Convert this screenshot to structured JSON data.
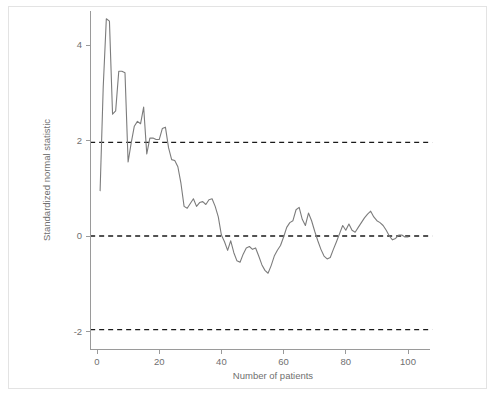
{
  "figure": {
    "background_color": "#ffffff",
    "border_color": "#e3e3e3",
    "line_color": "#7c7c7c",
    "reference_line_color": "#1a1a1a",
    "axis_color": "#9a9a9a",
    "text_color": "#6f6f6f"
  },
  "chart_data": {
    "type": "line",
    "title": "",
    "subtitle": "",
    "xlabel": "Number of patients",
    "ylabel": "Standardized normal statistic",
    "xlim": [
      -2,
      107
    ],
    "ylim": [
      -2.45,
      4.75
    ],
    "xticks": [
      0,
      20,
      40,
      60,
      80,
      100
    ],
    "xtick_labels": [
      "0",
      "20",
      "40",
      "60",
      "80",
      "100"
    ],
    "yticks": [
      -2,
      0,
      2,
      4
    ],
    "ytick_labels": [
      "-2",
      "0",
      "2",
      "4"
    ],
    "grid": false,
    "legend": null,
    "legend_position": "none",
    "annotations": [],
    "reference_lines": [
      {
        "name": "upper-boundary",
        "y": 1.96,
        "style": "dashed",
        "label": ""
      },
      {
        "name": "zero-line",
        "y": 0.0,
        "style": "dashed",
        "label": ""
      },
      {
        "name": "lower-boundary",
        "y": -1.96,
        "style": "dashed",
        "label": ""
      }
    ],
    "series": [
      {
        "name": "Standardized normal statistic",
        "x": [
          1,
          2,
          3,
          4,
          5,
          6,
          7,
          8,
          9,
          10,
          11,
          12,
          13,
          14,
          15,
          16,
          17,
          18,
          19,
          20,
          21,
          22,
          23,
          24,
          25,
          26,
          27,
          28,
          29,
          30,
          31,
          32,
          33,
          34,
          35,
          36,
          37,
          38,
          39,
          40,
          41,
          42,
          43,
          44,
          45,
          46,
          47,
          48,
          49,
          50,
          51,
          52,
          53,
          54,
          55,
          56,
          57,
          58,
          59,
          60,
          61,
          62,
          63,
          64,
          65,
          66,
          67,
          68,
          69,
          70,
          71,
          72,
          73,
          74,
          75,
          76,
          77,
          78,
          79,
          80,
          81,
          82,
          83,
          84,
          85,
          86,
          87,
          88,
          89,
          90,
          91,
          92,
          93,
          94,
          95,
          96,
          97,
          98,
          99,
          100
        ],
        "values": [
          0.95,
          3.12,
          4.55,
          4.5,
          2.55,
          2.62,
          3.45,
          3.45,
          3.42,
          1.55,
          1.95,
          2.3,
          2.4,
          2.35,
          2.7,
          1.72,
          2.05,
          2.05,
          2.02,
          2.02,
          2.25,
          2.28,
          1.85,
          1.6,
          1.58,
          1.45,
          1.1,
          0.62,
          0.58,
          0.68,
          0.78,
          0.62,
          0.7,
          0.72,
          0.66,
          0.76,
          0.78,
          0.62,
          0.4,
          0.02,
          -0.12,
          -0.3,
          -0.1,
          -0.35,
          -0.52,
          -0.55,
          -0.38,
          -0.25,
          -0.22,
          -0.28,
          -0.25,
          -0.42,
          -0.6,
          -0.72,
          -0.78,
          -0.62,
          -0.42,
          -0.3,
          -0.2,
          -0.02,
          0.18,
          0.28,
          0.32,
          0.55,
          0.6,
          0.35,
          0.22,
          0.48,
          0.32,
          0.1,
          -0.1,
          -0.28,
          -0.42,
          -0.48,
          -0.45,
          -0.28,
          -0.12,
          0.05,
          0.22,
          0.12,
          0.25,
          0.12,
          0.08,
          0.18,
          0.28,
          0.38,
          0.46,
          0.52,
          0.4,
          0.32,
          0.28,
          0.22,
          0.12,
          0.0,
          -0.08,
          -0.05,
          0.02,
          0.02,
          -0.02,
          -0.02
        ]
      }
    ]
  }
}
